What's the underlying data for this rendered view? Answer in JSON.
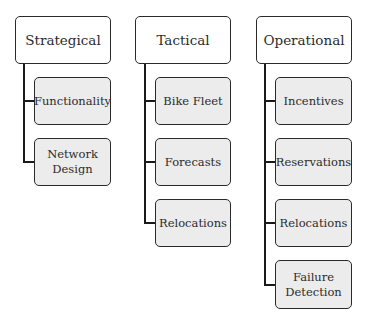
{
  "diagram": {
    "columns": [
      {
        "title": "Strategical",
        "children": [
          "Functionality",
          "Network\nDesign"
        ]
      },
      {
        "title": "Tactical",
        "children": [
          "Bike Fleet",
          "Forecasts",
          "Relocations"
        ]
      },
      {
        "title": "Operational",
        "children": [
          "Incentives",
          "Reservations",
          "Relocations",
          "Failure\nDetection"
        ]
      }
    ],
    "colors": {
      "border": "#2a2a2a",
      "child_fill": "#ececec",
      "top_fill": "#ffffff",
      "connector": "#1a1a1a"
    }
  }
}
